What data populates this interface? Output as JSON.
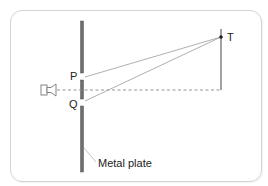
{
  "diagram": {
    "labels": {
      "P": "P",
      "Q": "Q",
      "T": "T",
      "plate": "Metal plate"
    },
    "elements": {
      "source": "loudspeaker",
      "barrier": "metal plate with two slits P and Q",
      "detector_point": "T"
    },
    "colors": {
      "plate": "#6e6e6e",
      "lines": "#9a9a9a",
      "border": "#d4d4d4",
      "text": "#222222"
    }
  }
}
